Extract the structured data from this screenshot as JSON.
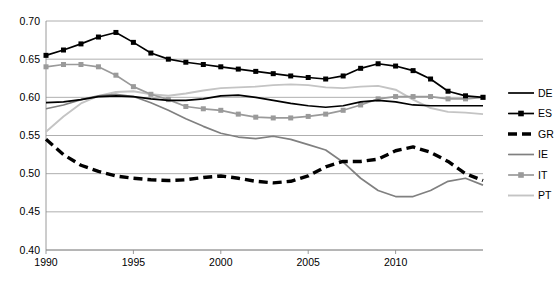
{
  "chart_data": {
    "type": "line",
    "title": "",
    "xlabel": "",
    "ylabel": "",
    "xlim": [
      1990,
      2015
    ],
    "ylim": [
      0.4,
      0.7
    ],
    "grid": true,
    "legend_position": "right",
    "y_ticks": [
      "0.70",
      "0.65",
      "0.60",
      "0.55",
      "0.50",
      "0.45",
      "0.40"
    ],
    "y_tick_values": [
      0.7,
      0.65,
      0.6,
      0.55,
      0.5,
      0.45,
      0.4
    ],
    "x_ticks": [
      "1990",
      "1995",
      "2000",
      "2005",
      "2010"
    ],
    "x_tick_values": [
      1990,
      1995,
      2000,
      2005,
      2010
    ],
    "x": [
      1990,
      1991,
      1992,
      1993,
      1994,
      1995,
      1996,
      1997,
      1998,
      1999,
      2000,
      2001,
      2002,
      2003,
      2004,
      2005,
      2006,
      2007,
      2008,
      2009,
      2010,
      2011,
      2012,
      2013,
      2014,
      2015
    ],
    "series": [
      {
        "name": "DE",
        "style": "solid",
        "color": "#000000",
        "width": 1.7,
        "markers": false,
        "values": [
          0.593,
          0.594,
          0.597,
          0.601,
          0.602,
          0.601,
          0.598,
          0.596,
          0.596,
          0.598,
          0.602,
          0.603,
          0.6,
          0.596,
          0.592,
          0.589,
          0.587,
          0.589,
          0.594,
          0.596,
          0.594,
          0.59,
          0.589,
          0.589,
          0.589,
          0.589
        ]
      },
      {
        "name": "ES",
        "style": "solid",
        "color": "#000000",
        "width": 1.7,
        "markers": true,
        "marker": "square",
        "values": [
          0.655,
          0.662,
          0.67,
          0.679,
          0.685,
          0.672,
          0.658,
          0.65,
          0.646,
          0.643,
          0.64,
          0.637,
          0.634,
          0.631,
          0.628,
          0.626,
          0.624,
          0.628,
          0.638,
          0.644,
          0.641,
          0.635,
          0.624,
          0.608,
          0.602,
          0.6
        ]
      },
      {
        "name": "GR",
        "style": "dashed",
        "color": "#000000",
        "width": 3.4,
        "dash": "9,5",
        "markers": false,
        "values": [
          0.545,
          0.525,
          0.511,
          0.503,
          0.497,
          0.494,
          0.492,
          0.491,
          0.492,
          0.495,
          0.497,
          0.494,
          0.49,
          0.488,
          0.49,
          0.497,
          0.509,
          0.516,
          0.516,
          0.519,
          0.53,
          0.535,
          0.528,
          0.516,
          0.5,
          0.491
        ]
      },
      {
        "name": "IE",
        "style": "solid",
        "color": "#808080",
        "width": 1.7,
        "markers": false,
        "values": [
          0.585,
          0.59,
          0.597,
          0.602,
          0.604,
          0.601,
          0.593,
          0.583,
          0.572,
          0.562,
          0.553,
          0.548,
          0.546,
          0.549,
          0.545,
          0.538,
          0.531,
          0.515,
          0.494,
          0.478,
          0.47,
          0.47,
          0.478,
          0.49,
          0.494,
          0.485
        ]
      },
      {
        "name": "IT",
        "style": "solid",
        "color": "#9a9a9a",
        "width": 1.7,
        "markers": true,
        "marker": "square",
        "values": [
          0.64,
          0.643,
          0.643,
          0.64,
          0.629,
          0.614,
          0.604,
          0.597,
          0.588,
          0.585,
          0.583,
          0.578,
          0.574,
          0.573,
          0.573,
          0.575,
          0.578,
          0.583,
          0.59,
          0.598,
          0.601,
          0.601,
          0.601,
          0.598,
          0.598,
          0.6
        ]
      },
      {
        "name": "PT",
        "style": "solid",
        "color": "#c4c4c4",
        "width": 1.9,
        "markers": false,
        "values": [
          0.555,
          0.575,
          0.592,
          0.602,
          0.607,
          0.608,
          0.604,
          0.602,
          0.605,
          0.609,
          0.612,
          0.613,
          0.614,
          0.616,
          0.617,
          0.616,
          0.613,
          0.612,
          0.614,
          0.615,
          0.61,
          0.597,
          0.586,
          0.581,
          0.58,
          0.578
        ]
      }
    ],
    "legend": [
      {
        "label": "DE"
      },
      {
        "label": "ES"
      },
      {
        "label": "GR"
      },
      {
        "label": "IE"
      },
      {
        "label": "IT"
      },
      {
        "label": "PT"
      }
    ]
  }
}
